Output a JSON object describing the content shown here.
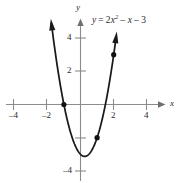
{
  "chart_data": {
    "type": "line",
    "title": "",
    "subtitle": "",
    "equation_text": "y = 2x2 - x - 3",
    "equation_parts": {
      "lhs": "y",
      "equals": "=",
      "coef": "2",
      "var": "x",
      "exponent": "2",
      "term2": "– x",
      "term3": "– 3"
    },
    "function": "y = 2x^2 - x - 3",
    "xlabel": "x",
    "ylabel": "y",
    "xlim": [
      -5.2,
      5.6
    ],
    "ylim": [
      -5.2,
      5.4
    ],
    "grid": false,
    "legend": "none",
    "x_ticks": [
      -4,
      -2,
      2,
      4
    ],
    "x_tick_labels": [
      "-4",
      "-2",
      "2",
      "4"
    ],
    "y_ticks": [
      -4,
      -2,
      2,
      4
    ],
    "y_tick_labels": [
      "-4",
      "",
      "2",
      "4"
    ],
    "x_unlabeled_ticks": [],
    "y_unlabeled_ticks": [
      -2
    ],
    "curve": {
      "name": "y = 2x^2 - x - 3",
      "color": "#1a1a1a",
      "x": [
        -1.75,
        -1.6,
        -1.4,
        -1.2,
        -1.0,
        -0.8,
        -0.6,
        -0.4,
        -0.2,
        0.0,
        0.25,
        0.5,
        0.75,
        1.0,
        1.2,
        1.4,
        1.6,
        1.8,
        2.0,
        2.15
      ],
      "y": [
        4.87,
        3.72,
        2.32,
        1.08,
        0.0,
        -0.92,
        -1.68,
        -2.28,
        -2.72,
        -3.0,
        -3.125,
        -3.0,
        -2.625,
        -2.0,
        -1.32,
        -0.48,
        0.52,
        1.68,
        3.0,
        4.4
      ]
    },
    "marked_points": [
      {
        "label": "x-intercept",
        "x": -1,
        "y": 0
      },
      {
        "label": "point",
        "x": 1,
        "y": -2
      },
      {
        "label": "point",
        "x": 2,
        "y": 3
      }
    ],
    "vertex": {
      "x": 0.25,
      "y": -3.125
    },
    "arrow_tips": [
      {
        "x": -1.75,
        "y": 4.87
      },
      {
        "x": 2.15,
        "y": 4.4
      }
    ],
    "axis_arrows": [
      "x-positive",
      "y-positive"
    ]
  },
  "labels": {
    "x_axis_name": "x",
    "y_axis_name": "y",
    "tick_x_neg4": "–4",
    "tick_x_neg2": "–2",
    "tick_x_pos2": "2",
    "tick_x_pos4": "4",
    "tick_y_pos4": "4",
    "tick_y_pos2": "2",
    "tick_y_neg4": "–4"
  },
  "colors": {
    "curve": "#1a1a1a",
    "axis": "#8c8c8c",
    "text": "#2b2b2b",
    "point": "#111111",
    "background": "#ffffff"
  }
}
